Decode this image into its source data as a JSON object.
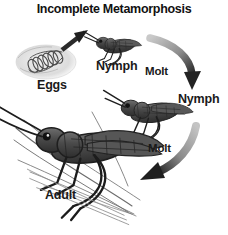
{
  "figure": {
    "title": "Incomplete Metamorphosis",
    "background_color": "#ffffff",
    "text_color": "#1a1a1a",
    "art_ink_color": "#3a3a3a",
    "arrow_dark_color": "#2b2b2b",
    "arrow_light_color": "#b9b9b9"
  },
  "labels": {
    "eggs": "Eggs",
    "nymph_1": "Nymph",
    "molt_1": "Molt",
    "nymph_2": "Nymph",
    "molt_2": "Molt",
    "adult": "Adult"
  },
  "stages": [
    {
      "name": "Eggs",
      "label": "Eggs",
      "order": 1,
      "description": "coiled egg pod buried in soil pocket"
    },
    {
      "name": "Nymph",
      "label": "Nymph",
      "order": 2,
      "description": "small wingless nymph grasshopper"
    },
    {
      "name": "Nymph",
      "label": "Nymph",
      "order": 3,
      "description": "larger nymph grasshopper with wing pads"
    },
    {
      "name": "Adult",
      "label": "Adult",
      "order": 4,
      "description": "full-size winged adult grasshopper on grass stems"
    }
  ],
  "arrows": [
    {
      "from": "Eggs",
      "to": "Nymph",
      "label": "",
      "style": "straight",
      "direction": "up-right"
    },
    {
      "from": "Nymph",
      "to": "Nymph",
      "label": "Molt",
      "style": "curved",
      "direction": "right-down"
    },
    {
      "from": "Nymph",
      "to": "Adult",
      "label": "Molt",
      "style": "curved",
      "direction": "down-left"
    }
  ]
}
